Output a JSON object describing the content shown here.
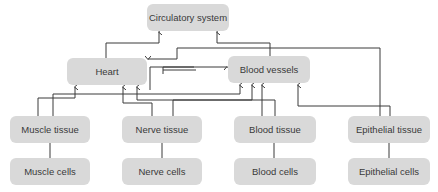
{
  "diagram": {
    "line_color": "#3a3a3a",
    "box_color": "#d9d9d9",
    "nodes": {
      "circulatory": "Circulatory system",
      "heart": "Heart",
      "vessels": "Blood vessels",
      "muscle_tissue": "Muscle tissue",
      "nerve_tissue": "Nerve tissue",
      "blood_tissue": "Blood tissue",
      "epithelial_tissue": "Epithelial tissue",
      "muscle_cells": "Muscle cells",
      "nerve_cells": "Nerve cells",
      "blood_cells": "Blood cells",
      "epithelial_cells": "Epithelial cells"
    },
    "edges": [
      [
        "heart",
        "circulatory"
      ],
      [
        "vessels",
        "circulatory"
      ],
      [
        "muscle_tissue",
        "heart"
      ],
      [
        "muscle_tissue",
        "vessels"
      ],
      [
        "nerve_tissue",
        "heart"
      ],
      [
        "nerve_tissue",
        "vessels"
      ],
      [
        "blood_tissue",
        "heart"
      ],
      [
        "blood_tissue",
        "vessels"
      ],
      [
        "epithelial_tissue",
        "heart"
      ],
      [
        "epithelial_tissue",
        "vessels"
      ],
      [
        "muscle_cells",
        "muscle_tissue"
      ],
      [
        "nerve_cells",
        "nerve_tissue"
      ],
      [
        "blood_cells",
        "blood_tissue"
      ],
      [
        "epithelial_cells",
        "epithelial_tissue"
      ]
    ]
  }
}
